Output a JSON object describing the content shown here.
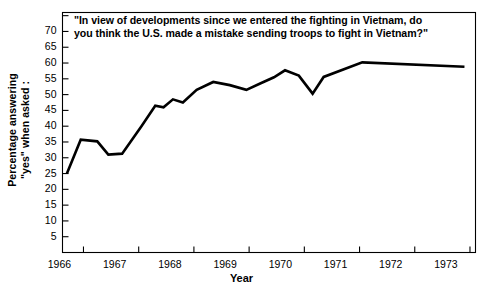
{
  "chart_data": {
    "type": "line",
    "title": "\"In view of developments since we entered the fighting in Vietnam, do you think the U.S. made a mistake sending troops to fight in Vietnam?\"",
    "title_line1": "\"In view of developments since we entered the fighting in Vietnam, do",
    "title_line2": "you think the U.S. made a mistake sending troops to fight in Vietnam?\"",
    "xlabel": "Year",
    "ylabel": "Percentage answering",
    "ylabel_line2": "\"yes\" when asked :",
    "xlim": [
      1965.62,
      1973.1
    ],
    "ylim": [
      0,
      76
    ],
    "grid": false,
    "legend": "none",
    "line_color": "#000000",
    "x_tick_values": [
      1966,
      1967,
      1968,
      1969,
      1970,
      1971,
      1972,
      1973
    ],
    "x_tick_labels": [
      "1966",
      "1967",
      "1968",
      "1969",
      "1970",
      "1971",
      "1972",
      "1973"
    ],
    "y_tick_values": [
      5,
      10,
      15,
      20,
      25,
      30,
      35,
      40,
      45,
      50,
      55,
      60,
      65,
      70,
      75
    ],
    "y_tick_labels": [
      "5",
      "10",
      "15",
      "20",
      "25",
      "30",
      "35",
      "40",
      "45",
      "50",
      "55",
      "60",
      "65",
      "70",
      ""
    ],
    "series": [
      {
        "name": "Percentage answering yes",
        "x": [
          1965.7,
          1965.95,
          1966.25,
          1966.45,
          1966.7,
          1967.05,
          1967.3,
          1967.45,
          1967.62,
          1967.8,
          1968.05,
          1968.35,
          1968.65,
          1968.95,
          1969.2,
          1969.45,
          1969.65,
          1969.9,
          1970.15,
          1970.35,
          1971.05,
          1972.9
        ],
        "y": [
          25.0,
          35.7,
          35.2,
          31.0,
          31.3,
          40.0,
          46.5,
          46.0,
          48.5,
          47.5,
          51.5,
          54.0,
          53.0,
          51.5,
          53.5,
          55.5,
          57.7,
          56.0,
          50.3,
          55.6,
          60.2,
          58.8
        ]
      }
    ]
  }
}
